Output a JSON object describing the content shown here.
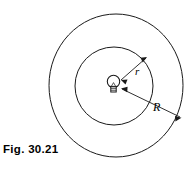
{
  "figure": {
    "caption": "Fig. 30.21",
    "labels": {
      "inner_radius": "r",
      "outer_radius": "R"
    },
    "icons": {
      "bulb": "light-bulb-icon"
    },
    "colors": {
      "stroke": "#1a1a1a",
      "background": "#ffffff",
      "text": "#000000"
    },
    "geometry": {
      "center_x": 114,
      "center_y": 85,
      "inner_circle_radius": 39,
      "outer_circle_radius": 70,
      "inner_label_x": 136,
      "inner_label_y": 72,
      "outer_label_x": 156,
      "outer_label_y": 108
    }
  }
}
